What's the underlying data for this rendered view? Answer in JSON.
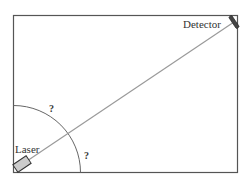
{
  "diagram": {
    "labels": {
      "detector": "Detector",
      "laser": "Laser",
      "angle_upper": "?",
      "angle_lower": "?"
    },
    "colors": {
      "frame": "#555555",
      "beam": "#9a9a9a",
      "arc": "#666666",
      "laser_fill": "#cccccc",
      "detector_fill": "#444444"
    }
  }
}
